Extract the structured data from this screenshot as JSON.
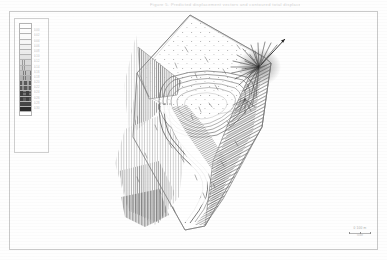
{
  "document": {
    "kind": "scanned-engineering-figure",
    "header_caption": "Figure 5.  Predicted displacement vectors and contoured total displacement magnitude, pit slope model",
    "background_color": "#fefefe",
    "frame_color": "#c9c9c9",
    "ink_color": "#3a3a3a"
  },
  "legend": {
    "name": "displacement-magnitude-colour-scale",
    "title": "",
    "unit_label": "m",
    "swatches": [
      {
        "label": "",
        "fill": "#ffffff",
        "pattern": "none"
      },
      {
        "label": "0.00",
        "fill": "#fdfdfd",
        "pattern": "none"
      },
      {
        "label": "0.02",
        "fill": "#fbfbfb",
        "pattern": "none"
      },
      {
        "label": "0.04",
        "fill": "#f7f7f7",
        "pattern": "none"
      },
      {
        "label": "0.06",
        "fill": "#f2f2f2",
        "pattern": "none"
      },
      {
        "label": "0.08",
        "fill": "#ececec",
        "pattern": "dots-fine"
      },
      {
        "label": "0.10",
        "fill": "#e4e4e4",
        "pattern": "dots-fine"
      },
      {
        "label": "0.12",
        "fill": "#dadada",
        "pattern": "hatch-light"
      },
      {
        "label": "0.14",
        "fill": "#cfcfcf",
        "pattern": "hatch-light"
      },
      {
        "label": "0.16",
        "fill": "#c2c2c2",
        "pattern": "hatch"
      },
      {
        "label": "0.18",
        "fill": "#b2b2b2",
        "pattern": "hatch"
      },
      {
        "label": "0.20",
        "fill": "#a0a0a0",
        "pattern": "hatch-dense"
      },
      {
        "label": "0.22",
        "fill": "#8c8c8c",
        "pattern": "hatch-dense"
      },
      {
        "label": "0.24",
        "fill": "#757575",
        "pattern": "crosshatch"
      },
      {
        "label": "0.26",
        "fill": "#5d5d5d",
        "pattern": "crosshatch"
      },
      {
        "label": "0.28",
        "fill": "#454545",
        "pattern": "solid"
      },
      {
        "label": "0.30",
        "fill": "#2b2b2b",
        "pattern": "solid"
      },
      {
        "label": "",
        "fill": "#ffffff",
        "pattern": "none"
      }
    ]
  },
  "map": {
    "name": "pit-slope-perspective-block-model",
    "description": "Three-dimensional perspective view of an open pit slope block showing benched pit crest, haul ramp descending the footwall, shaded/hatched slope faces and a radiating displacement vector fan at the upper right crest",
    "features": [
      {
        "name": "model-block-outline",
        "type": "polygon"
      },
      {
        "name": "pit-crest-bench-contours",
        "type": "polyline-group"
      },
      {
        "name": "haul-ramp",
        "type": "corridor"
      },
      {
        "name": "hatched-slope-face-west",
        "type": "shaded-region"
      },
      {
        "name": "hatched-slope-face-east",
        "type": "shaded-region"
      },
      {
        "name": "displacement-vector-fan",
        "type": "vector-field"
      },
      {
        "name": "scattered-vector-arrows",
        "type": "vector-field"
      }
    ]
  },
  "scale_annotation": {
    "name": "scale-bar",
    "value_label": "0   100 m",
    "sub_label": "scale"
  }
}
